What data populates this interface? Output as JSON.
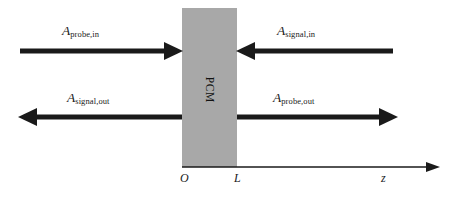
{
  "figure": {
    "type": "optical-schematic",
    "background_color": "#ffffff",
    "arrow_color": "#1a1a1a",
    "block_color": "#a8a8a8",
    "axis_color": "#1a1a1a"
  },
  "medium": {
    "label": "PCM",
    "left_boundary_label": "O",
    "right_boundary_label": "L"
  },
  "axis": {
    "name": "z",
    "label": "z"
  },
  "beams": [
    {
      "id": "probe-in",
      "symbol": "A",
      "subscript": "probe,in",
      "direction": "right",
      "position": "top-left"
    },
    {
      "id": "signal-in",
      "symbol": "A",
      "subscript": "signal,in",
      "direction": "left",
      "position": "top-right"
    },
    {
      "id": "signal-out",
      "symbol": "A",
      "subscript": "signal,out",
      "direction": "left",
      "position": "bottom-left"
    },
    {
      "id": "probe-out",
      "symbol": "A",
      "subscript": "probe,out",
      "direction": "right",
      "position": "bottom-right"
    }
  ]
}
